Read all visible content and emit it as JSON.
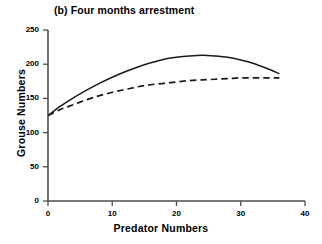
{
  "chart_data": {
    "type": "line",
    "title": "(b) Four months arrestment",
    "xlabel": "Predator Numbers",
    "ylabel": "Grouse Numbers",
    "xlim": [
      0,
      40
    ],
    "ylim": [
      0,
      250
    ],
    "xticks": [
      0,
      10,
      20,
      30,
      40
    ],
    "yticks": [
      0,
      50,
      100,
      150,
      200,
      250
    ],
    "xtick_labels": [
      "0",
      "10",
      "20",
      "30",
      "40"
    ],
    "ytick_labels": [
      "0",
      "50",
      "100",
      "150",
      "200",
      "250"
    ],
    "grid": false,
    "legend": "none",
    "x": [
      0,
      2,
      4,
      6,
      8,
      10,
      12,
      14,
      16,
      18,
      20,
      22,
      24,
      26,
      28,
      30,
      32,
      34,
      36
    ],
    "series": [
      {
        "name": "solid-curve",
        "style": "solid",
        "color": "#1a1a1a",
        "values": [
          125,
          139,
          151,
          162,
          172,
          181,
          189,
          196,
          202,
          207,
          210,
          212,
          213,
          212,
          210,
          206,
          201,
          194,
          186
        ]
      },
      {
        "name": "dashed-curve",
        "style": "dashed",
        "color": "#1a1a1a",
        "values": [
          125,
          134,
          141,
          148,
          154,
          159,
          163,
          167,
          170,
          172,
          174,
          176,
          177,
          178,
          179,
          180,
          180,
          180,
          180
        ]
      }
    ]
  },
  "axis": {
    "line_color": "#4d4d4d"
  }
}
